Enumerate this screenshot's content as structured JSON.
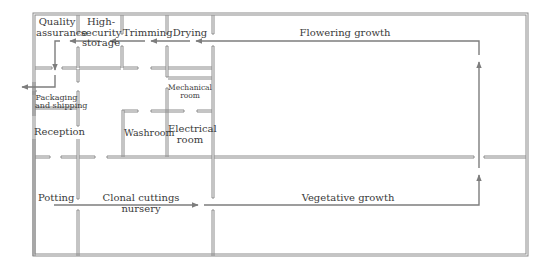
{
  "diagram": {
    "type": "floor-plan",
    "colors": {
      "walls": "#8a8a8a",
      "arrows": "#7d7d7d",
      "text": "#3a3a3a",
      "background": "#ffffff"
    }
  },
  "rooms": {
    "quality_assurance": {
      "line1": "Quality",
      "line2": "assurance"
    },
    "high_security_storage": {
      "line1": "High-",
      "line2": "security",
      "line3": "storage"
    },
    "trimming": {
      "label": "Trimming"
    },
    "drying": {
      "label": "Drying"
    },
    "flowering_growth": {
      "label": "Flowering growth"
    },
    "packaging_shipping": {
      "line1": "Packaging",
      "line2": "and shipping"
    },
    "mechanical_room": {
      "line1": "Mechanical",
      "line2": "room"
    },
    "reception": {
      "label": "Reception"
    },
    "washroom": {
      "label": "Washroom"
    },
    "electrical_room": {
      "line1": "Electrical",
      "line2": "room"
    },
    "potting": {
      "label": "Potting"
    },
    "clonal_cuttings_nursery": {
      "line1": "Clonal cuttings",
      "line2": "nursery"
    },
    "vegetative_growth": {
      "label": "Vegetative growth"
    }
  },
  "flow": [
    "Potting",
    "Clonal cuttings nursery",
    "Vegetative growth",
    "Flowering growth",
    "Drying",
    "Trimming",
    "High-security storage",
    "Quality assurance",
    "Packaging and shipping",
    "Exit"
  ]
}
